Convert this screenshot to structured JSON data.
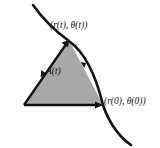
{
  "figure": {
    "type": "geometry-diagram",
    "background_color": "#ffffff",
    "stroke_color": "#141414",
    "fill_color": "#a8a8a8",
    "labels": {
      "point_at_time_t": "(r(t), θ(t))",
      "point_at_time_zero": "(r(0), θ(0))",
      "area": "A(t)"
    },
    "geometry": {
      "origin_vertex": [
        24,
        105
      ],
      "vertex_at_time_t": [
        69,
        40
      ],
      "vertex_at_time_zero": [
        103,
        105
      ],
      "curve_start": [
        33,
        5
      ],
      "curve_end": [
        131,
        145
      ]
    },
    "arrows": {
      "radius_vector_t": "arrowhead pointing up-right at vertex (r(t), theta(t))",
      "radius_vector_0": "arrowhead pointing right at vertex (r(0), theta(0))",
      "edge_marker_left": "direction arrowhead on left edge",
      "edge_marker_right": "direction arrowhead on right edge"
    }
  }
}
